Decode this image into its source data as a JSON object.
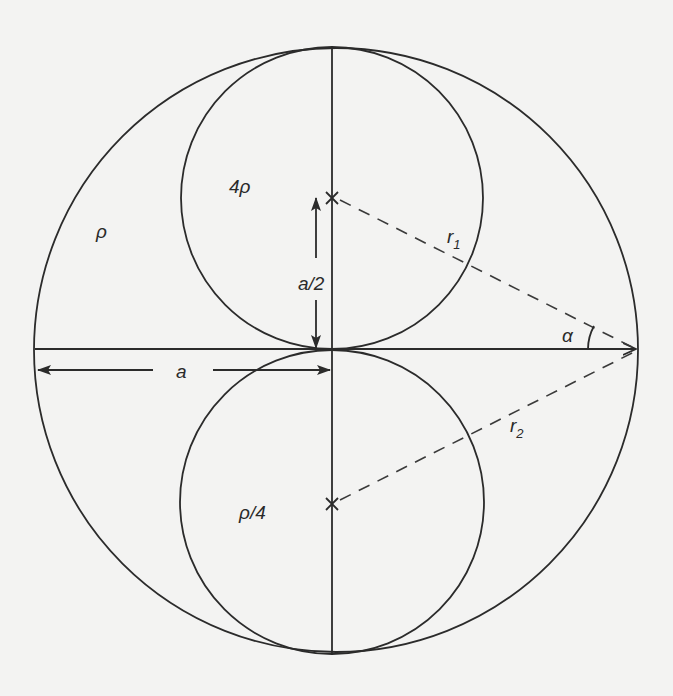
{
  "diagram": {
    "background": "#f3f3f2",
    "stroke_color": "#2b2b2b",
    "outer_circle": {
      "density_label": "ρ"
    },
    "upper_inner_circle": {
      "density_label": "4ρ",
      "center_marker": "x"
    },
    "lower_inner_circle": {
      "density_label": "ρ/4",
      "center_marker": "x"
    },
    "dimensions": {
      "half_spacing_label": "a/2",
      "radius_label": "a"
    },
    "distances": {
      "r1_label": "r",
      "r1_sub": "1",
      "r2_label": "r",
      "r2_sub": "2"
    },
    "angle_label": "α"
  }
}
